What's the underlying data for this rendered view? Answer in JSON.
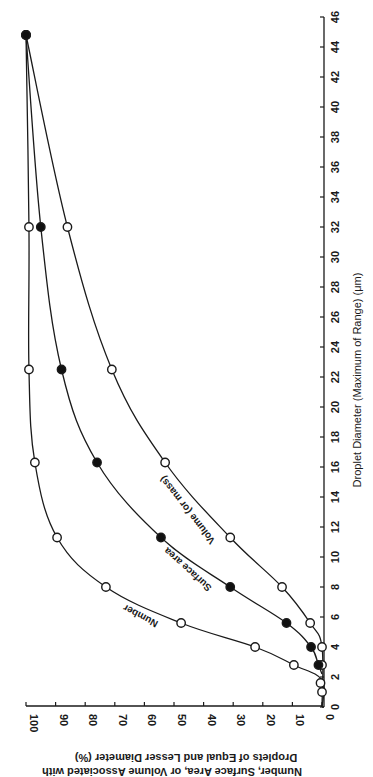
{
  "chart_data": {
    "type": "line",
    "orientation": "rotated 90° counter-clockwise (diameter axis vertical on right, percent axis horizontal at bottom)",
    "title": "",
    "xlabel": "Droplet Diameter (Maximum of Range) (μm)",
    "ylabel_line1": "Number, Surface Area, or Volume Associated with",
    "ylabel_line2": "Droplets of Equal and Lesser Diameter (%)",
    "xlim": [
      0,
      46
    ],
    "ylim": [
      0,
      100
    ],
    "x_ticks": [
      0,
      2,
      4,
      6,
      8,
      10,
      12,
      14,
      16,
      18,
      20,
      22,
      24,
      26,
      28,
      30,
      32,
      34,
      36,
      38,
      40,
      42,
      44,
      46
    ],
    "y_ticks": [
      0,
      10,
      20,
      30,
      40,
      50,
      60,
      70,
      80,
      90,
      100
    ],
    "grid": false,
    "legend": "inline labels along curves",
    "series": [
      {
        "name": "Number",
        "marker": "open",
        "points": [
          [
            1.0,
            0
          ],
          [
            1.6,
            0.5
          ],
          [
            2.8,
            9.5
          ],
          [
            4.0,
            22.6
          ],
          [
            5.6,
            47.6
          ],
          [
            8.0,
            73
          ],
          [
            11.3,
            89.5
          ],
          [
            16.3,
            97
          ],
          [
            22.5,
            99
          ],
          [
            32.0,
            99
          ],
          [
            44.8,
            100
          ]
        ]
      },
      {
        "name": "Surface area",
        "marker": "filled",
        "points": [
          [
            2.8,
            1.2
          ],
          [
            4.0,
            3.7
          ],
          [
            5.6,
            12
          ],
          [
            8.0,
            31
          ],
          [
            11.3,
            54.4
          ],
          [
            16.3,
            76
          ],
          [
            22.5,
            88
          ],
          [
            32.0,
            95
          ],
          [
            44.8,
            100
          ]
        ]
      },
      {
        "name": "Volume (or mass)",
        "marker": "open",
        "points": [
          [
            2.8,
            0
          ],
          [
            4.0,
            0
          ],
          [
            5.6,
            4
          ],
          [
            8.0,
            13.5
          ],
          [
            11.3,
            31
          ],
          [
            16.3,
            53
          ],
          [
            22.5,
            71
          ],
          [
            32.0,
            86
          ],
          [
            44.8,
            100
          ]
        ]
      }
    ]
  },
  "labels": {
    "x_title": "Droplet Diameter (Maximum of Range) (μm)",
    "y_title_line1": "Number, Surface Area, or Volume Associated with",
    "y_title_line2": "Droplets of Equal and Lesser Diameter (%)",
    "curve_number": "Number",
    "curve_surface": "Surface area",
    "curve_volume": "Volume (or mass)"
  },
  "colors": {
    "ink": "#1a1a1a",
    "background": "#ffffff",
    "open_marker_fill": "#ffffff",
    "filled_marker_fill": "#111111"
  }
}
